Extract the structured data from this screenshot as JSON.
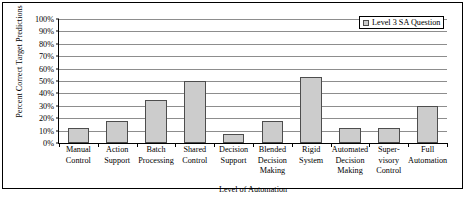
{
  "chart_data": {
    "type": "bar",
    "title": "",
    "xlabel": "Level of Automation",
    "ylabel": "Percent Correct Target Predictions",
    "ylim": [
      0,
      100
    ],
    "ytick_labels": [
      "0%",
      "10%",
      "20%",
      "30%",
      "40%",
      "50%",
      "60%",
      "70%",
      "80%",
      "90%",
      "100%"
    ],
    "ytick_values": [
      0,
      10,
      20,
      30,
      40,
      50,
      60,
      70,
      80,
      90,
      100
    ],
    "grid": true,
    "legend_position": "top-right",
    "categories": [
      "Manual Control",
      "Action Support",
      "Batch Processing",
      "Shared Control",
      "Decision Support",
      "Blended Decision Making",
      "Rigid System",
      "Automated Decision Making",
      "Supervisory Control",
      "Full Automation"
    ],
    "category_lines": [
      [
        "Manual",
        "Control"
      ],
      [
        "Action",
        "Support"
      ],
      [
        "Batch",
        "Processing"
      ],
      [
        "Shared",
        "Control"
      ],
      [
        "Decision",
        "Support"
      ],
      [
        "Blended",
        "Decision",
        "Making"
      ],
      [
        "Rigid",
        "System"
      ],
      [
        "Automated",
        "Decision",
        "Making"
      ],
      [
        "Super-",
        "visory",
        "Control"
      ],
      [
        "Full",
        "Automation"
      ]
    ],
    "series": [
      {
        "name": "Level 3 SA Question",
        "values": [
          12,
          18,
          35,
          50,
          7,
          18,
          53,
          12,
          12,
          30
        ],
        "fill_color": "#cccccc",
        "edge_color": "#4d4d4d"
      }
    ]
  },
  "legend": {
    "entries": [
      {
        "label": "Level 3 SA Question",
        "swatch_color": "#cccccc"
      }
    ]
  },
  "axes": {
    "y_title": "Percent Correct Target Predictions",
    "x_title": "Level of Automation"
  }
}
